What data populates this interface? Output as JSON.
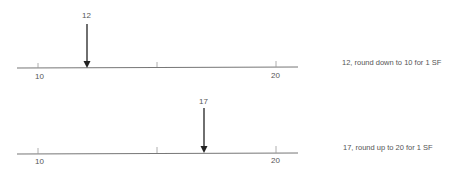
{
  "diagrams": [
    {
      "value": "12",
      "ticks": [
        "10",
        "20"
      ],
      "caption": "12, round down to 10 for 1 SF"
    },
    {
      "value": "17",
      "ticks": [
        "10",
        "20"
      ],
      "caption": "17, round up to 20 for 1 SF"
    }
  ],
  "colors": {
    "line": "#666666",
    "arrow": "#222222",
    "text": "#555555"
  }
}
